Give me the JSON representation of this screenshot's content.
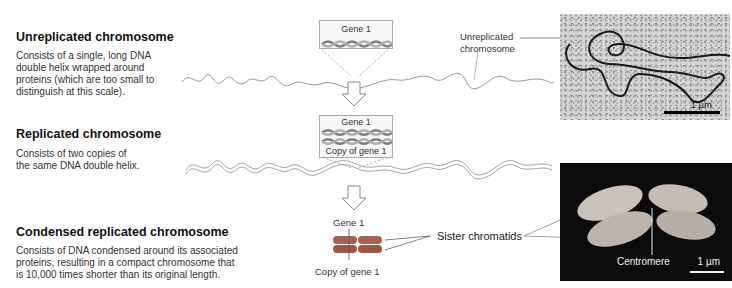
{
  "sections": [
    {
      "title": "Unreplicated chromosome",
      "description_lines": [
        "Consists of a single, long DNA",
        "double helix wrapped around",
        "proteins (which are too small to",
        "distinguish at this scale)."
      ]
    },
    {
      "title": "Replicated chromosome",
      "description_lines": [
        "Consists of two copies of",
        "the same DNA double helix."
      ]
    },
    {
      "title": "Condensed replicated chromosome",
      "description_lines": [
        "Consists of DNA condensed around its associated",
        "proteins, resulting in a compact chromosome that",
        "is 10,000 times shorter than its original length."
      ]
    }
  ],
  "gene_boxes": {
    "unreplicated": {
      "gene_label": "Gene 1"
    },
    "replicated": {
      "gene_label": "Gene 1",
      "copy_label": "Copy of gene 1"
    }
  },
  "condensed_labels": {
    "gene_label": "Gene 1",
    "copy_label": "Copy of gene 1",
    "sister_chromatids": "Sister chromatids"
  },
  "micrographs": {
    "unreplicated": {
      "callout_lines": [
        "Unreplicated",
        "chromosome"
      ],
      "scale": "1 µm"
    },
    "condensed": {
      "centromere_label": "Centromere",
      "scale": "1 µm"
    }
  },
  "colors": {
    "dna_strand": "#9a9a9a",
    "helix": "#8a8a8a",
    "chromatid": "#a25a4a",
    "arrow": "#888888"
  }
}
